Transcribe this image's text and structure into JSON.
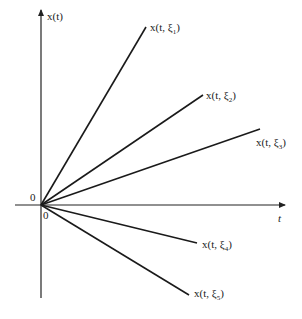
{
  "diagram": {
    "type": "sample_paths",
    "origin": {
      "x": 41,
      "y": 205
    },
    "axes": {
      "vertical": {
        "label": "x(t)",
        "top": 10,
        "bottom": 298
      },
      "horizontal": {
        "label": "t",
        "left": 15,
        "right": 285
      }
    },
    "origin_labels": {
      "left": "0",
      "below": "0"
    },
    "lines": [
      {
        "name": "x(t, ξ1)",
        "prefix": "x(t, ξ",
        "sub": "1",
        "end": {
          "x": 146,
          "y": 27
        },
        "label_pos": {
          "x": 150,
          "y": 31
        }
      },
      {
        "name": "x(t, ξ2)",
        "prefix": "x(t, ξ",
        "sub": "2",
        "end": {
          "x": 203,
          "y": 95
        },
        "label_pos": {
          "x": 206,
          "y": 99
        }
      },
      {
        "name": "x(t, ξ3)",
        "prefix": "x(t, ξ",
        "sub": "3",
        "end": {
          "x": 260,
          "y": 129
        },
        "label_pos": {
          "x": 256,
          "y": 146
        }
      },
      {
        "name": "x(t, ξ4)",
        "prefix": "x(t, ξ",
        "sub": "4",
        "end": {
          "x": 197,
          "y": 243
        },
        "label_pos": {
          "x": 202,
          "y": 248
        }
      },
      {
        "name": "x(t, ξ5)",
        "prefix": "x(t, ξ",
        "sub": "5",
        "end": {
          "x": 189,
          "y": 295
        },
        "label_pos": {
          "x": 194,
          "y": 297
        }
      }
    ]
  }
}
